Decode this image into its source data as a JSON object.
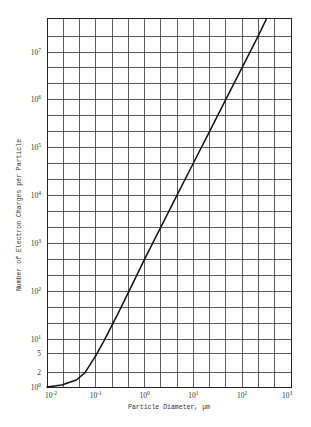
{
  "chart_data": {
    "type": "line",
    "title": "",
    "xlabel": "Particle Diameter, μm",
    "ylabel": "Number of Electron Charges per Particle",
    "xscale": "log",
    "yscale": "log",
    "xlim": [
      0.01,
      1000
    ],
    "ylim": [
      1,
      50000000
    ],
    "grid": true,
    "legend": null,
    "x_ticks": [
      {
        "value": 0.01,
        "base": "10",
        "exp": "-2"
      },
      {
        "value": 0.1,
        "base": "10",
        "exp": "-1"
      },
      {
        "value": 1,
        "base": "10",
        "exp": "0"
      },
      {
        "value": 10,
        "base": "10",
        "exp": "1"
      },
      {
        "value": 100,
        "base": "10",
        "exp": "2"
      },
      {
        "value": 1000,
        "base": "10",
        "exp": "3"
      }
    ],
    "y_ticks": [
      {
        "value": 1,
        "base": "10",
        "exp": "0"
      },
      {
        "value": 2,
        "base": "2",
        "exp": ""
      },
      {
        "value": 5,
        "base": "5",
        "exp": ""
      },
      {
        "value": 10,
        "base": "10",
        "exp": "1"
      },
      {
        "value": 100,
        "base": "10",
        "exp": "2"
      },
      {
        "value": 1000,
        "base": "10",
        "exp": "3"
      },
      {
        "value": 10000,
        "base": "10",
        "exp": "4"
      },
      {
        "value": 100000,
        "base": "10",
        "exp": "5"
      },
      {
        "value": 1000000,
        "base": "10",
        "exp": "6"
      },
      {
        "value": 10000000,
        "base": "10",
        "exp": "7"
      }
    ],
    "series": [
      {
        "name": "Electron charges vs particle diameter",
        "points": [
          {
            "x": 0.01,
            "y": 1.0
          },
          {
            "x": 0.02,
            "y": 1.1
          },
          {
            "x": 0.04,
            "y": 1.4
          },
          {
            "x": 0.06,
            "y": 2.0
          },
          {
            "x": 0.1,
            "y": 4.5
          },
          {
            "x": 0.15,
            "y": 9.5
          },
          {
            "x": 0.2,
            "y": 17
          },
          {
            "x": 0.3,
            "y": 38
          },
          {
            "x": 0.5,
            "y": 110
          },
          {
            "x": 1,
            "y": 470
          },
          {
            "x": 2,
            "y": 1900
          },
          {
            "x": 5,
            "y": 12000
          },
          {
            "x": 10,
            "y": 48000
          },
          {
            "x": 20,
            "y": 190000
          },
          {
            "x": 50,
            "y": 1200000
          },
          {
            "x": 100,
            "y": 4800000
          },
          {
            "x": 200,
            "y": 19000000
          },
          {
            "x": 310,
            "y": 48000000
          }
        ]
      }
    ]
  }
}
